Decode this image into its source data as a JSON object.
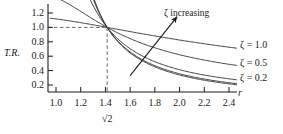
{
  "chart_data": {
    "type": "line",
    "title": "",
    "xlabel": "r",
    "ylabel": "T.R.",
    "xlim": [
      0.9,
      2.55
    ],
    "ylim": [
      0.08,
      1.28
    ],
    "grid": false,
    "legend_position": "right-of-curves",
    "xticks": [
      1.0,
      1.2,
      1.4,
      1.6,
      1.8,
      2.0,
      2.2,
      2.4
    ],
    "xtick_labels": [
      "1.0",
      "1.2",
      "1.4",
      "1.6",
      "1.8",
      "2.0",
      "2.2",
      "2.4"
    ],
    "yticks": [
      0.2,
      0.4,
      0.6,
      0.8,
      1.0,
      1.2
    ],
    "ytick_labels": [
      "0.2",
      "0.4",
      "0.6",
      "0.8",
      "1.0",
      "1.2"
    ],
    "x": [
      1.0,
      1.05,
      1.1,
      1.15,
      1.2,
      1.25,
      1.3,
      1.35,
      1.4142,
      1.5,
      1.6,
      1.7,
      1.8,
      1.9,
      2.0,
      2.1,
      2.2,
      2.3,
      2.4,
      2.5
    ],
    "series": [
      {
        "name": "zeta-1.0",
        "label": "ζ = 1.0",
        "zeta": 1.0,
        "values": [
          1.118,
          1.107,
          1.096,
          1.084,
          1.072,
          1.059,
          1.046,
          1.033,
          1.0,
          0.97,
          0.93,
          0.891,
          0.854,
          0.819,
          0.786,
          0.755,
          0.726,
          0.7,
          0.675,
          0.652
        ]
      },
      {
        "name": "zeta-0.5",
        "label": "ζ = 0.5",
        "zeta": 0.5,
        "values": [
          1.118,
          1.09,
          1.062,
          1.034,
          1.007,
          0.981,
          0.956,
          0.932,
          1.0,
          0.826,
          0.755,
          0.694,
          0.641,
          0.596,
          0.556,
          0.522,
          0.491,
          0.464,
          0.44,
          0.418
        ]
      },
      {
        "name": "zeta-0.2",
        "label": "ζ = 0.2",
        "zeta": 0.2,
        "values": [
          2.551,
          2.28,
          1.87,
          1.54,
          1.3,
          1.13,
          1.0,
          0.9,
          1.0,
          0.69,
          0.578,
          0.49,
          0.42,
          0.366,
          0.322,
          0.287,
          0.258,
          0.233,
          0.212,
          0.194
        ]
      },
      {
        "name": "zeta-0.1",
        "label": "",
        "zeta": 0.1,
        "values": [
          5.025,
          3.74,
          2.46,
          1.78,
          1.39,
          1.14,
          0.97,
          0.845,
          1.0,
          0.627,
          0.514,
          0.431,
          0.367,
          0.318,
          0.279,
          0.248,
          0.222,
          0.2,
          0.182,
          0.167
        ]
      },
      {
        "name": "zeta-0.05",
        "label": "",
        "zeta": 0.05,
        "values": [
          10.0,
          5.2,
          2.72,
          1.86,
          1.42,
          1.15,
          0.975,
          0.845,
          1.0,
          0.618,
          0.504,
          0.421,
          0.357,
          0.309,
          0.27,
          0.24,
          0.215,
          0.194,
          0.176,
          0.161
        ]
      }
    ],
    "annotations": [
      {
        "name": "zeta-increasing",
        "text": "ζ increasing",
        "arrow_from": [
          1.6,
          0.33
        ],
        "arrow_to": [
          1.98,
          1.15
        ]
      },
      {
        "name": "sqrt-two-marker",
        "text": "√2",
        "at_x": 1.4142
      },
      {
        "name": "crossover-guides",
        "text": "",
        "horizontal_at_y": 1.0,
        "vertical_at_x": 1.4142,
        "style": "dashed"
      }
    ]
  },
  "axis": {
    "y_label": "T.R.",
    "x_label": "r"
  },
  "colors": {
    "ink": "#1a1a1a",
    "curve": "#2b2b2b",
    "guide": "#555555",
    "background": "#ffffff"
  }
}
